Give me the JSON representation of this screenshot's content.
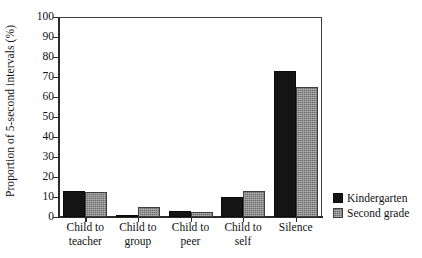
{
  "chart_data": {
    "type": "bar",
    "title": "",
    "xlabel": "",
    "ylabel": "Proportion of 5-second intervals (%)",
    "ylim": [
      0,
      100
    ],
    "ytick_step": 10,
    "yticks": [
      100,
      90,
      80,
      70,
      60,
      50,
      40,
      30,
      20,
      10,
      0
    ],
    "grid": false,
    "legend_position": "right",
    "categories": [
      "Child to teacher",
      "Child to group",
      "Child to peer",
      "Child to self",
      "Silence"
    ],
    "category_lines": [
      [
        "Child to",
        "teacher"
      ],
      [
        "Child to",
        "group"
      ],
      [
        "Child to",
        "peer"
      ],
      [
        "Child to",
        "self"
      ],
      [
        "Silence",
        ""
      ]
    ],
    "series": [
      {
        "name": "Kindergarten",
        "color": "#141414",
        "values": [
          13,
          1,
          3,
          10,
          73
        ]
      },
      {
        "name": "Second grade",
        "color": "#6d6d6d",
        "values": [
          12.5,
          5,
          2.5,
          13,
          65
        ]
      }
    ]
  },
  "legend": {
    "entries": [
      {
        "label": "Kindergarten",
        "swatch": "kindergarten-swatch"
      },
      {
        "label": "Second grade",
        "swatch": "second-grade-swatch"
      }
    ]
  }
}
